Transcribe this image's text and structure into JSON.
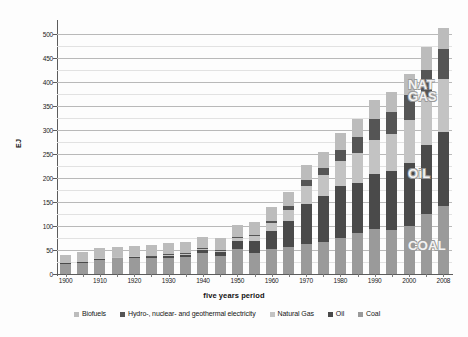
{
  "chart_data": {
    "type": "bar",
    "stacked": true,
    "title": "",
    "subtitle": "",
    "xlabel": "five years period",
    "ylabel": "EJ",
    "ylim": [
      0,
      525
    ],
    "ytick_step": 50,
    "yminor_step": 25,
    "grid": true,
    "legend_position": "bottom",
    "ytick_labels": [
      "0",
      "50",
      "100",
      "150",
      "200",
      "250",
      "300",
      "350",
      "400",
      "450",
      "500"
    ],
    "ytick_values": [
      0,
      50,
      100,
      150,
      200,
      250,
      300,
      350,
      400,
      450,
      500
    ],
    "categories": [
      "1900",
      "1905",
      "1910",
      "1915",
      "1920",
      "1925",
      "1930",
      "1935",
      "1940",
      "1945",
      "1950",
      "1955",
      "1960",
      "1965",
      "1970",
      "1975",
      "1980",
      "1985",
      "1990",
      "1995",
      "2000",
      "2005",
      "2008"
    ],
    "xtick_labels_shown": [
      "1900",
      "1910",
      "1920",
      "1930",
      "1940",
      "1950",
      "1960",
      "1970",
      "1980",
      "1990",
      "2000",
      "2008"
    ],
    "series": [
      {
        "name": "Coal",
        "color": "#9a9a9a",
        "values": [
          22,
          24,
          31,
          33,
          34,
          33,
          34,
          35,
          44,
          38,
          52,
          44,
          52,
          56,
          62,
          66,
          74,
          86,
          94,
          92,
          100,
          124,
          142
        ]
      },
      {
        "name": "Oil",
        "color": "#4a4a4a",
        "values": [
          1,
          1,
          1,
          2,
          2,
          3,
          4,
          5,
          6,
          7,
          17,
          25,
          38,
          54,
          84,
          96,
          110,
          104,
          114,
          122,
          132,
          144,
          154
        ]
      },
      {
        "name": "Natural Gas",
        "color": "#c3c3c3",
        "values": [
          0,
          0,
          1,
          1,
          1,
          1,
          2,
          2,
          3,
          4,
          6,
          10,
          16,
          24,
          38,
          44,
          52,
          62,
          72,
          78,
          88,
          100,
          110
        ]
      },
      {
        "name": "Hydro-, nuclear- and geothermal electricity",
        "color": "#555555",
        "values": [
          0,
          0,
          0,
          0,
          0,
          1,
          1,
          1,
          1,
          1,
          2,
          3,
          5,
          7,
          11,
          15,
          22,
          34,
          42,
          46,
          52,
          58,
          62
        ]
      },
      {
        "name": "Biofuels",
        "color": "#bcbcbc",
        "values": [
          17,
          20,
          21,
          21,
          22,
          22,
          23,
          23,
          24,
          24,
          25,
          26,
          28,
          30,
          32,
          34,
          36,
          38,
          40,
          42,
          44,
          46,
          44
        ]
      }
    ],
    "totals": [
      40,
      45,
      54,
      57,
      59,
      60,
      64,
      66,
      78,
      74,
      102,
      108,
      139,
      171,
      227,
      255,
      294,
      324,
      362,
      380,
      416,
      472,
      512
    ],
    "annotations": [
      {
        "text": "NAT\nGAS",
        "series": "Natural Gas"
      },
      {
        "text": "OiL",
        "series": "Oil"
      },
      {
        "text": "COAL",
        "series": "Coal"
      }
    ]
  },
  "legend": {
    "items": [
      {
        "label": "Biofuels",
        "color": "#bcbcbc"
      },
      {
        "label": "Hydro-, nuclear- and geothermal electricity",
        "color": "#555555"
      },
      {
        "label": "Natural Gas",
        "color": "#c3c3c3"
      },
      {
        "label": "Oil",
        "color": "#4a4a4a"
      },
      {
        "label": "Coal",
        "color": "#9a9a9a"
      }
    ]
  }
}
